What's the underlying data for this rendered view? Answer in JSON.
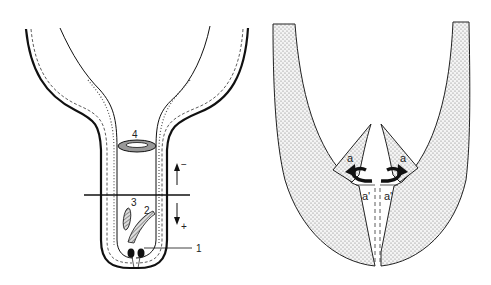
{
  "figure": {
    "left_panel": {
      "description": "Longitudinal section of tubular organ with funnel-shaped upper part",
      "labels": {
        "item1": "1",
        "item2": "2",
        "item3": "3",
        "item4": "4",
        "arrow_up": "−",
        "arrow_down": "+"
      }
    },
    "right_panel": {
      "description": "Stippled U-shaped wall with inward folding flaps",
      "labels": {
        "flap_left": "a",
        "flap_right": "a",
        "base_left": "a'",
        "base_right": "a'"
      }
    },
    "colors": {
      "line": "#111111",
      "stipple": "#8a8a8a",
      "background": "#ffffff"
    }
  }
}
